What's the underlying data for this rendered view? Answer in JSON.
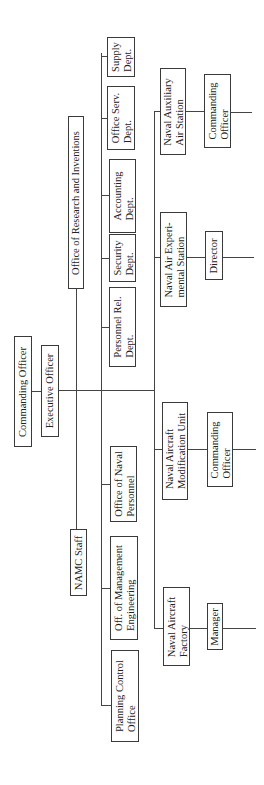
{
  "chart": {
    "orientation": "rotated -90deg (read bottom-to-top)",
    "root": {
      "id": "co",
      "label": [
        "Commanding Officer"
      ]
    },
    "executive": {
      "id": "xo",
      "label": [
        "Executive Officer"
      ]
    },
    "staff_branches": [
      {
        "id": "namc",
        "label": [
          "NAMC Staff"
        ],
        "children": [
          {
            "id": "pco",
            "label": [
              "Planning Control",
              "Office"
            ]
          },
          {
            "id": "ome",
            "label": [
              "Off. of Management",
              "Engineering"
            ]
          },
          {
            "id": "onp",
            "label": [
              "Office of Naval",
              "Personnel"
            ]
          }
        ]
      },
      {
        "id": "ori",
        "label": [
          "Office of Research and Inventions"
        ],
        "children": [
          {
            "id": "prd",
            "label": [
              "Personnel Rel.",
              "Dept."
            ]
          },
          {
            "id": "sec",
            "label": [
              "Security",
              "Dept."
            ]
          },
          {
            "id": "acc",
            "label": [
              "Accounting",
              "Dept."
            ]
          },
          {
            "id": "osd",
            "label": [
              "Office Serv.",
              "Dept."
            ]
          },
          {
            "id": "sup",
            "label": [
              "Supply",
              "Dept."
            ]
          }
        ]
      }
    ],
    "line_units": [
      {
        "id": "naf",
        "label": [
          "Naval Aircraft",
          "Factory"
        ],
        "head": {
          "label": [
            "Manager"
          ]
        }
      },
      {
        "id": "namu",
        "label": [
          "Naval Aircraft",
          "Modification Unit"
        ],
        "head": {
          "label": [
            "Commanding",
            "Officer"
          ]
        }
      },
      {
        "id": "naes",
        "label": [
          "Naval Air Experi-",
          "mental Station"
        ],
        "head": {
          "label": [
            "Director"
          ]
        }
      },
      {
        "id": "naas",
        "label": [
          "Naval Auxiliary",
          "Air Station"
        ],
        "head": {
          "label": [
            "Commanding",
            "Officer"
          ]
        }
      }
    ]
  }
}
